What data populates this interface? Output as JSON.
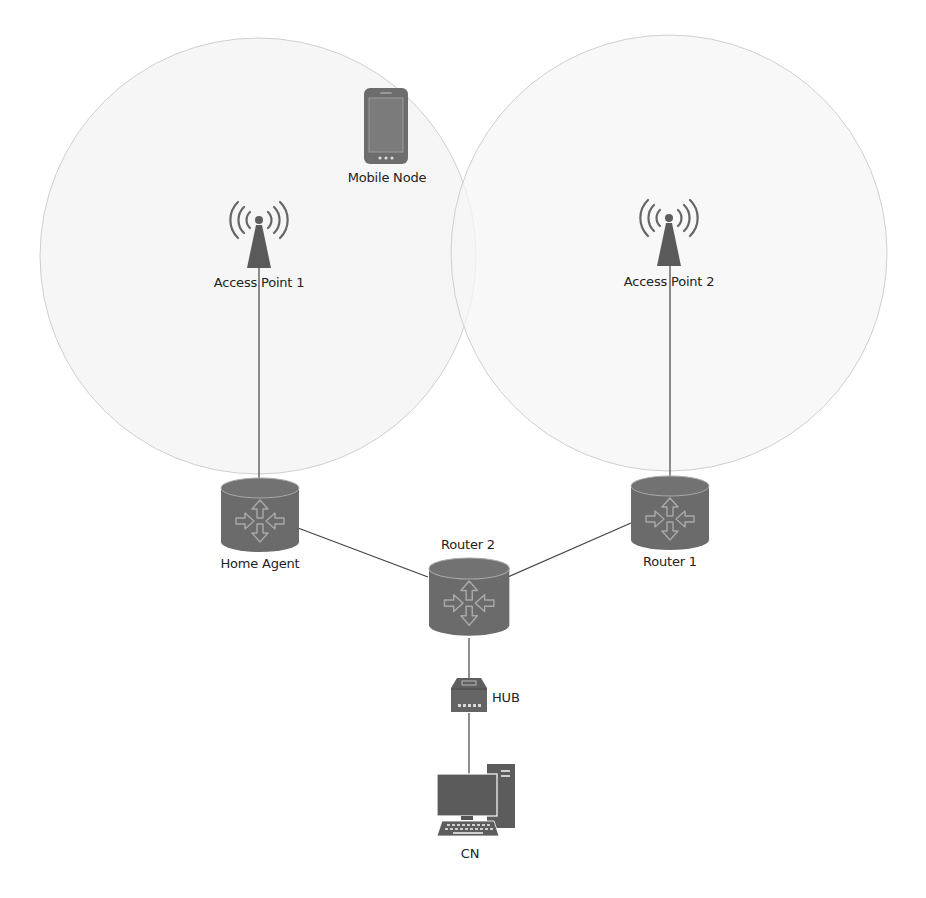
{
  "diagram": {
    "colors": {
      "coverage_fill": "#f6f6f6",
      "coverage_stroke": "#cfcfcf",
      "device_fill": "#6e6e6e",
      "device_dark": "#4a4a4a",
      "arrow_stroke": "#9a9a9a",
      "link": "#444444",
      "text": "#222222"
    },
    "coverage_areas": [
      {
        "id": "cell-1",
        "cx": 258,
        "cy": 256,
        "r": 218
      },
      {
        "id": "cell-2",
        "cx": 669,
        "cy": 253,
        "r": 218
      }
    ],
    "nodes": {
      "mobile_node": {
        "label": "Mobile Node",
        "type": "smartphone-icon"
      },
      "access_point_1": {
        "label": "Access Point 1",
        "type": "wireless-tower-icon"
      },
      "access_point_2": {
        "label": "Access Point 2",
        "type": "wireless-tower-icon"
      },
      "home_agent": {
        "label": "Home Agent",
        "type": "router-icon"
      },
      "router_1": {
        "label": "Router 1",
        "type": "router-icon"
      },
      "router_2": {
        "label": "Router 2",
        "type": "router-icon"
      },
      "hub": {
        "label": "HUB",
        "type": "hub-icon"
      },
      "cn": {
        "label": "CN",
        "type": "desktop-computer-icon"
      }
    },
    "links": [
      {
        "from": "Access Point 1",
        "to": "Home Agent"
      },
      {
        "from": "Access Point 2",
        "to": "Router 1"
      },
      {
        "from": "Home Agent",
        "to": "Router 2"
      },
      {
        "from": "Router 1",
        "to": "Router 2"
      },
      {
        "from": "Router 2",
        "to": "HUB"
      },
      {
        "from": "HUB",
        "to": "CN"
      }
    ]
  }
}
